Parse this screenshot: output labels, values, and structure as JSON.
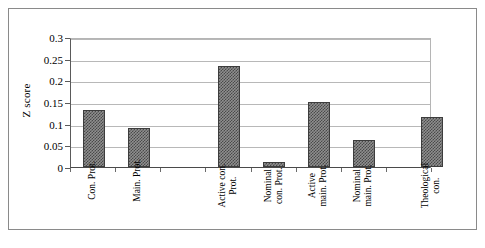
{
  "chart_data": {
    "type": "bar",
    "title": "",
    "xlabel": "",
    "ylabel": "Z score",
    "ylim": [
      0,
      0.3
    ],
    "ytick_labels": [
      "0",
      "0.05",
      "0.1",
      "0.15",
      "0.2",
      "0.25",
      "0.3"
    ],
    "ytick_values": [
      0,
      0.05,
      0.1,
      0.15,
      0.2,
      0.25,
      0.3
    ],
    "grid": true,
    "legend": "none",
    "categories": [
      "Con. Prot.",
      "Main. Prot.",
      "Active con.\nProt.",
      "Nominal\ncon. Prot.",
      "Active\nmain. Prot.",
      "Nominal\nmain. Prot.",
      "Theological\ncon."
    ],
    "values": [
      0.131,
      0.09,
      0.232,
      0.012,
      0.15,
      0.063,
      0.115
    ],
    "bar_color": "#7a7a7a",
    "bar_edge_color": "#3d3d3d",
    "gridline_color": "#b8b8b8",
    "axis_color": "#4a4a4a",
    "frame_color": "#8a8a8a",
    "background_color": "#ffffff"
  }
}
